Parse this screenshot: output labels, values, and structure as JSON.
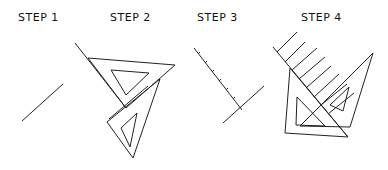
{
  "steps": [
    {
      "label": "STEP 1"
    },
    {
      "label": "STEP 2"
    },
    {
      "label": "STEP 3"
    },
    {
      "label": "STEP 4"
    }
  ],
  "colors": {
    "ink": "#222222",
    "background": "#ffffff"
  }
}
